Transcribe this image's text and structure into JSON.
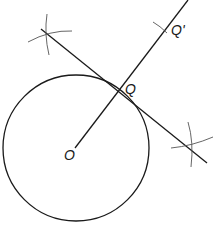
{
  "diagram": {
    "labels": {
      "center": "O",
      "tangent_point": "Q",
      "reflected_point": "Q'"
    },
    "colors": {
      "line": "#1a1a1a",
      "arc": "#555555",
      "background": "#ffffff"
    },
    "circle": {
      "cx": 76,
      "cy": 148,
      "r": 73
    },
    "radius_line": {
      "x1": 75,
      "y1": 148,
      "x2": 188,
      "y2": 0
    },
    "tangent_line": {
      "x1": 41,
      "y1": 29,
      "x2": 207,
      "y2": 163
    }
  }
}
